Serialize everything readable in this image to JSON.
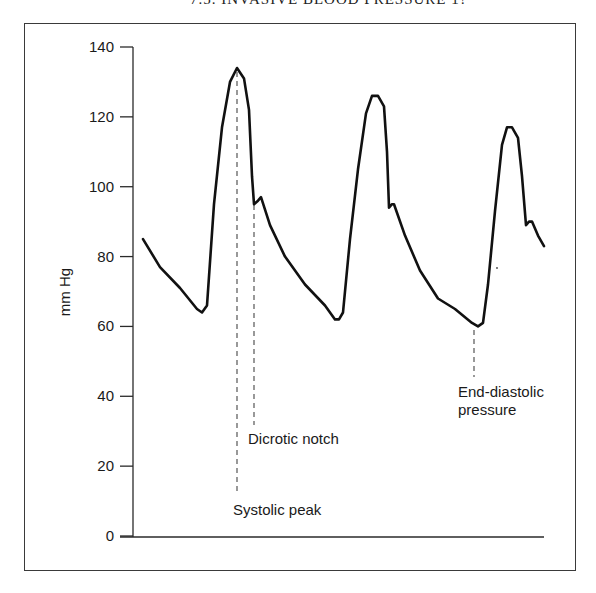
{
  "page": {
    "running_header": "7.5. INVASIVE BLOOD PRESSURE 1?"
  },
  "chart_data": {
    "type": "line",
    "title": "",
    "xlabel": "",
    "ylabel": "mm Hg",
    "ylim": [
      0,
      140
    ],
    "yticks": [
      0,
      20,
      40,
      60,
      80,
      100,
      120,
      140
    ],
    "ytick_labels": [
      "0",
      "20",
      "40",
      "60",
      "80",
      "100",
      "120",
      "140"
    ],
    "xticks": [],
    "grid": false,
    "legend": null,
    "series": [
      {
        "name": "Arterial pressure waveform",
        "points": [
          {
            "x": 143,
            "y": 85
          },
          {
            "x": 160,
            "y": 77
          },
          {
            "x": 180,
            "y": 71
          },
          {
            "x": 197,
            "y": 65
          },
          {
            "x": 202,
            "y": 64
          },
          {
            "x": 207,
            "y": 66
          },
          {
            "x": 214,
            "y": 95
          },
          {
            "x": 222,
            "y": 117
          },
          {
            "x": 230,
            "y": 130
          },
          {
            "x": 237,
            "y": 134
          },
          {
            "x": 244,
            "y": 131
          },
          {
            "x": 249,
            "y": 122
          },
          {
            "x": 252,
            "y": 103
          },
          {
            "x": 254,
            "y": 95
          },
          {
            "x": 258,
            "y": 96
          },
          {
            "x": 261,
            "y": 97
          },
          {
            "x": 270,
            "y": 89
          },
          {
            "x": 285,
            "y": 80
          },
          {
            "x": 305,
            "y": 72
          },
          {
            "x": 325,
            "y": 66
          },
          {
            "x": 335,
            "y": 62
          },
          {
            "x": 339,
            "y": 62
          },
          {
            "x": 343,
            "y": 64
          },
          {
            "x": 350,
            "y": 85
          },
          {
            "x": 358,
            "y": 105
          },
          {
            "x": 366,
            "y": 121
          },
          {
            "x": 372,
            "y": 126
          },
          {
            "x": 378,
            "y": 126
          },
          {
            "x": 384,
            "y": 123
          },
          {
            "x": 387,
            "y": 110
          },
          {
            "x": 389,
            "y": 94
          },
          {
            "x": 392,
            "y": 95
          },
          {
            "x": 394,
            "y": 95
          },
          {
            "x": 405,
            "y": 86
          },
          {
            "x": 420,
            "y": 76
          },
          {
            "x": 438,
            "y": 68
          },
          {
            "x": 455,
            "y": 65
          },
          {
            "x": 472,
            "y": 61
          },
          {
            "x": 478,
            "y": 60
          },
          {
            "x": 483,
            "y": 61
          },
          {
            "x": 488,
            "y": 72
          },
          {
            "x": 495,
            "y": 93
          },
          {
            "x": 502,
            "y": 112
          },
          {
            "x": 507,
            "y": 117
          },
          {
            "x": 512,
            "y": 117
          },
          {
            "x": 518,
            "y": 114
          },
          {
            "x": 522,
            "y": 103
          },
          {
            "x": 526,
            "y": 89
          },
          {
            "x": 529,
            "y": 90
          },
          {
            "x": 532,
            "y": 90
          },
          {
            "x": 538,
            "y": 86
          },
          {
            "x": 544,
            "y": 83
          }
        ]
      }
    ],
    "annotations": [
      {
        "text": "Systolic peak",
        "points_to_value": 134,
        "marker": "dashed vertical line"
      },
      {
        "text": "Dicrotic notch",
        "points_to_value": 95,
        "marker": "dashed vertical line"
      },
      {
        "text": "End-diastolic pressure",
        "points_to_value": 60,
        "marker": "dashed vertical line"
      }
    ]
  },
  "labels": {
    "ylabel": "mm Hg",
    "systolic": "Systolic peak",
    "dicrotic": "Dicrotic notch",
    "end_diastolic_line1": "End-diastolic",
    "end_diastolic_line2": "pressure"
  },
  "style": {
    "line_color": "#111111",
    "axis_color": "#2a2a2a",
    "frame_color": "#3a3a3a",
    "dash_color": "#555555"
  }
}
